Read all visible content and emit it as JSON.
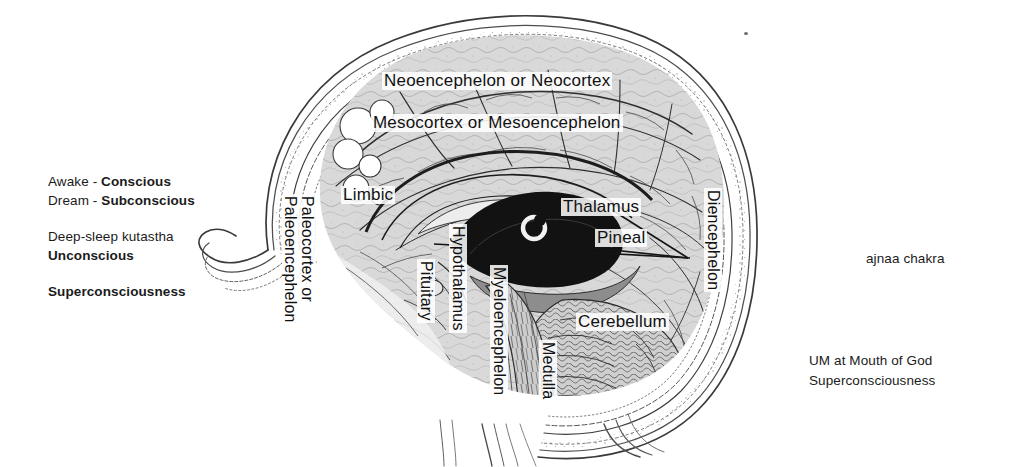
{
  "page": {
    "background_color": "#ffffff",
    "width": 1009,
    "height": 467
  },
  "left_annotations": {
    "group1": {
      "line1_prefix": "Awake - ",
      "line1_bold": "Conscious",
      "line2_prefix": "Dream - ",
      "line2_bold": "Subconscious"
    },
    "group2": {
      "line1": "Deep-sleep kutastha",
      "line2_bold": "Unconscious"
    },
    "group3": {
      "line1_bold": "Superconsciousness"
    }
  },
  "right_annotations": {
    "chakra": "ajnaa chakra",
    "bottom_line1": "UM at Mouth of God",
    "bottom_line2": "Superconsciousness"
  },
  "diagram_labels": {
    "neocortex": "Neoencephelon or Neocortex",
    "mesocortex": "Mesocortex or Mesoencephelon",
    "limbic": "Limbic",
    "thalamus": "Thalamus",
    "pineal": "Pineal",
    "cerebellum": "Cerebellum",
    "paleocortex_line1": "Paleocortex or",
    "paleocortex_line2": "Paleoencephelon",
    "hypothalamus": "Hypothalamus",
    "pituitary": "Pituitary",
    "myeloencephelon": "Myeloencephelon",
    "medulla": "Medulla",
    "diencephelon": "Diencephelon"
  },
  "colors": {
    "ink": "#1b1b1b",
    "label_ink": "#111111",
    "brain_fill": "#d8d8d8",
    "thalamus_fill": "#121212",
    "scalp_line": "#4a4a4a",
    "background": "#ffffff"
  }
}
